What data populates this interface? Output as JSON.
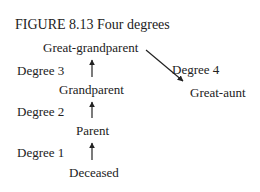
{
  "figure": {
    "caption": "FIGURE 8.13  Four degrees"
  },
  "nodes": {
    "great_grandparent": "Great-grandparent",
    "grandparent": "Grandparent",
    "parent": "Parent",
    "deceased": "Deceased",
    "great_aunt": "Great-aunt"
  },
  "degrees": {
    "d1": "Degree 1",
    "d2": "Degree 2",
    "d3": "Degree 3",
    "d4": "Degree 4"
  }
}
